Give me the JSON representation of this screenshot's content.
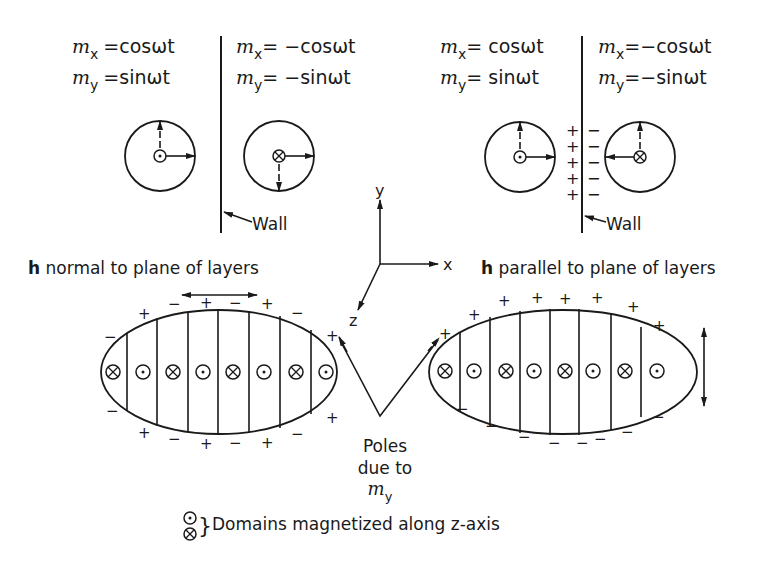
{
  "panels": {
    "left": {
      "side_a": {
        "mx_var": "m",
        "mx_sub": "x",
        "mx_eq": "=cosωt",
        "my_var": "m",
        "my_sub": "y",
        "my_eq": "=sinωt"
      },
      "side_b": {
        "mx_var": "m",
        "mx_sub": "x",
        "mx_eq": "= −cosωt",
        "my_var": "m",
        "my_sub": "y",
        "my_eq": "= −sinωt"
      },
      "wall_label": "Wall",
      "caption_bold": "h",
      "caption_rest": " normal to plane of layers"
    },
    "right": {
      "side_a": {
        "mx_var": "m",
        "mx_sub": "x",
        "mx_eq": "= cosωt",
        "my_var": "m",
        "my_sub": "y",
        "my_eq": "= sinωt"
      },
      "side_b": {
        "mx_var": "m",
        "mx_sub": "x",
        "mx_eq": "=−cosωt",
        "my_var": "m",
        "my_sub": "y",
        "my_eq": "=−sinωt"
      },
      "wall_label": "Wall",
      "wall_charges_left": [
        "+",
        "+",
        "+",
        "+",
        "+"
      ],
      "wall_charges_right": [
        "−",
        "−",
        "−",
        "−",
        "−"
      ],
      "caption_bold": "h",
      "caption_rest": " parallel to plane of layers"
    }
  },
  "axes": {
    "x": "x",
    "y": "y",
    "z": "z"
  },
  "poles_label": {
    "line1": "Poles",
    "line2": "due to",
    "line3_var": "m",
    "line3_sub": "y"
  },
  "legend": {
    "dot_symbol": "⊙",
    "cross_symbol": "⊗",
    "brace": "}",
    "text": "Domains magnetized along z-axis"
  },
  "domain_symbols": {
    "left_ellipse": [
      "cross",
      "dot",
      "cross",
      "dot",
      "cross",
      "dot",
      "cross",
      "dot"
    ],
    "right_ellipse": [
      "cross",
      "dot",
      "cross",
      "dot",
      "cross",
      "dot",
      "cross",
      "dot"
    ]
  },
  "charges": {
    "plus": "+",
    "minus": "−"
  },
  "colors": {
    "ink": "#1a1a1a",
    "background": "#ffffff"
  }
}
